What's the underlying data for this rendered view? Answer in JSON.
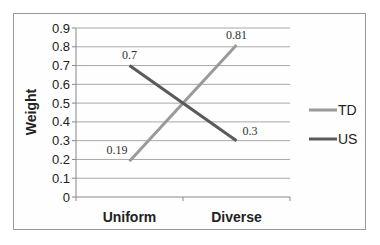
{
  "chart_data": {
    "type": "line",
    "title": "",
    "xlabel": "",
    "ylabel": "Weight",
    "categories": [
      "Uniform",
      "Diverse"
    ],
    "series": [
      {
        "name": "TD",
        "values": [
          0.19,
          0.81
        ],
        "color": "#9a9a9a",
        "labels": [
          "0.19",
          "0.81"
        ]
      },
      {
        "name": "US",
        "values": [
          0.7,
          0.3
        ],
        "color": "#5a5a5a",
        "labels": [
          "0.7",
          "0.3"
        ]
      }
    ],
    "ylim": [
      0,
      0.9
    ],
    "yticks": [
      "0",
      "0.1",
      "0.2",
      "0.3",
      "0.4",
      "0.5",
      "0.6",
      "0.7",
      "0.8",
      "0.9"
    ],
    "grid": true,
    "legend_position": "right"
  }
}
